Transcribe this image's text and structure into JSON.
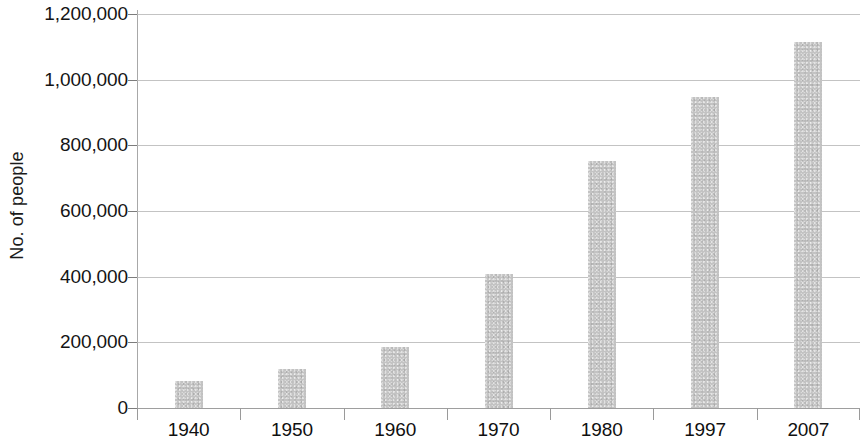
{
  "chart_data": {
    "type": "bar",
    "title": "",
    "xlabel": "",
    "ylabel": "No. of people",
    "categories": [
      "1940",
      "1950",
      "1960",
      "1970",
      "1980",
      "1997",
      "2007"
    ],
    "values": [
      82000,
      118000,
      186000,
      408000,
      753000,
      946000,
      1115000
    ],
    "ylim": [
      0,
      1200000
    ],
    "y_ticks": [
      0,
      200000,
      400000,
      600000,
      800000,
      1000000,
      1200000
    ],
    "y_tick_labels": [
      "0",
      "200,000",
      "400,000",
      "600,000",
      "800,000",
      "1,000,000",
      "1,200,000"
    ],
    "grid": true,
    "legend": false,
    "legend_position": "none",
    "bar_color": "#c3c3c3",
    "gridline_color": "#b9b9b9",
    "axis_color": "#8d8d8d",
    "text_color": "#141414",
    "background_color": "#ffffff"
  }
}
